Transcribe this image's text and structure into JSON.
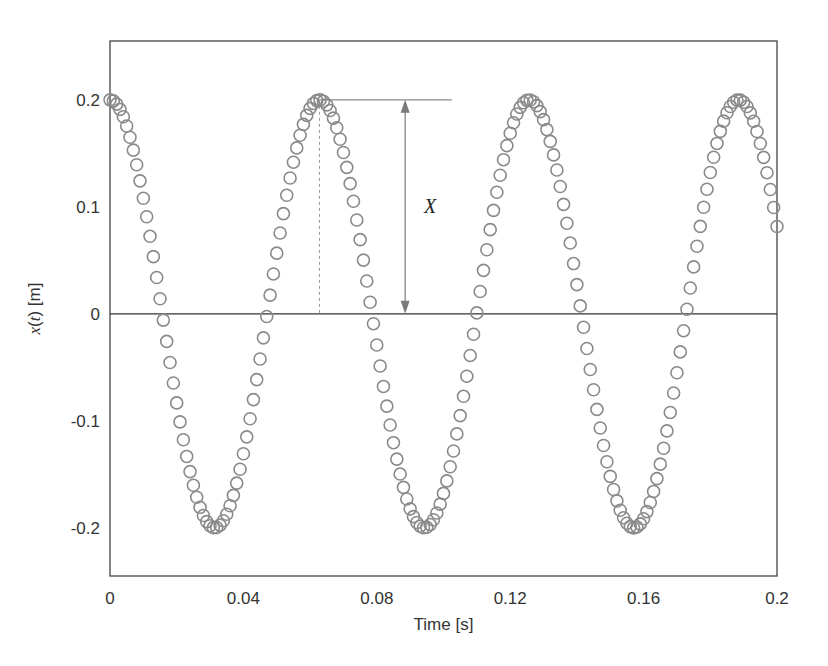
{
  "chart_data": {
    "type": "scatter",
    "title": "",
    "xlabel": "Time [s]",
    "ylabel_parts": {
      "var": "x",
      "arg": "t",
      "unit": " [m]"
    },
    "ylabel": "x(t) [m]",
    "xlim": [
      0,
      0.2
    ],
    "ylim": [
      -0.245,
      0.255
    ],
    "x_ticks": [
      0,
      0.04,
      0.08,
      0.12,
      0.16,
      0.2
    ],
    "x_tick_labels": [
      "0",
      "0.04",
      "0.08",
      "0.12",
      "0.16",
      "0.2"
    ],
    "y_ticks": [
      0.2,
      0.1,
      0,
      -0.1,
      -0.2
    ],
    "y_tick_labels": [
      "0.2",
      "0.1",
      "0",
      "-0.1",
      "-0.2"
    ],
    "grid": false,
    "legend": null,
    "zero_line": true,
    "marker": {
      "shape": "open-circle",
      "radius": 6,
      "stroke": "#8a8a8a"
    },
    "model": {
      "expression": "x(t) = 0.2 cos(100 t)",
      "amplitude": 0.2,
      "omega": 100,
      "phase": 0,
      "t_start": 0,
      "t_end": 0.2,
      "dt": 0.001
    },
    "series": [
      {
        "name": "x(t)",
        "sampled_points": {
          "t": [
            0,
            0.005,
            0.01,
            0.015,
            0.02,
            0.025,
            0.0314,
            0.035,
            0.04,
            0.045,
            0.05,
            0.055,
            0.0628,
            0.07,
            0.075,
            0.08,
            0.085,
            0.0942,
            0.1,
            0.105,
            0.11,
            0.115,
            0.1257,
            0.13,
            0.135,
            0.14,
            0.145,
            0.1571,
            0.165,
            0.17,
            0.175,
            0.1885,
            0.195,
            0.2
          ],
          "x": [
            0.2,
            0.176,
            0.108,
            0.014,
            -0.083,
            -0.16,
            -0.2,
            -0.187,
            -0.131,
            -0.042,
            0.057,
            0.142,
            0.2,
            0.151,
            0.069,
            -0.029,
            -0.119,
            -0.2,
            -0.168,
            -0.096,
            0.0,
            0.096,
            0.2,
            0.167,
            0.118,
            0.028,
            -0.07,
            -0.2,
            -0.138,
            -0.057,
            0.042,
            0.2,
            0.15,
            0.082
          ]
        }
      }
    ],
    "annotations": [
      {
        "type": "dimension-arrow",
        "label": "X",
        "from_y": 0,
        "to_y": 0.2,
        "at_t": 0.0885,
        "ref_line_t": [
          0.0628,
          0.1025
        ],
        "dashed_drop_t": 0.0628
      }
    ]
  },
  "ui": {
    "xlabel": "Time [s]",
    "annotation_label": "X"
  }
}
